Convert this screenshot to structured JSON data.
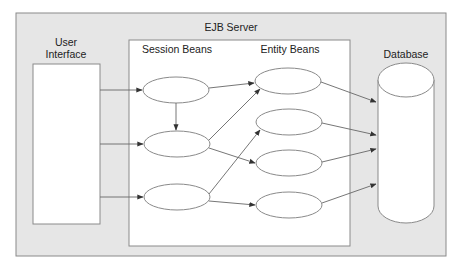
{
  "diagram": {
    "title": "EJB Server",
    "user_interface": {
      "label_line1": "User",
      "label_line2": "Interface"
    },
    "session_beans": {
      "label": "Session Beans",
      "count": 3
    },
    "entity_beans": {
      "label": "Entity Beans",
      "count": 4
    },
    "database": {
      "label": "Database"
    },
    "colors": {
      "frame_fill": "#e6e6e6",
      "box_fill": "#ffffff",
      "stroke": "#7a7a7a",
      "arrow": "#555555",
      "text": "#222222"
    },
    "edges": [
      {
        "from": "user-interface",
        "to": "session-bean-1"
      },
      {
        "from": "user-interface",
        "to": "session-bean-2"
      },
      {
        "from": "user-interface",
        "to": "session-bean-3"
      },
      {
        "from": "session-bean-1",
        "to": "session-bean-2"
      },
      {
        "from": "session-bean-1",
        "to": "entity-bean-1"
      },
      {
        "from": "session-bean-2",
        "to": "entity-bean-1"
      },
      {
        "from": "session-bean-2",
        "to": "entity-bean-3"
      },
      {
        "from": "session-bean-3",
        "to": "entity-bean-2"
      },
      {
        "from": "session-bean-3",
        "to": "entity-bean-4"
      },
      {
        "from": "entity-bean-1",
        "to": "database"
      },
      {
        "from": "entity-bean-2",
        "to": "database"
      },
      {
        "from": "entity-bean-3",
        "to": "database"
      },
      {
        "from": "entity-bean-4",
        "to": "database"
      }
    ]
  }
}
